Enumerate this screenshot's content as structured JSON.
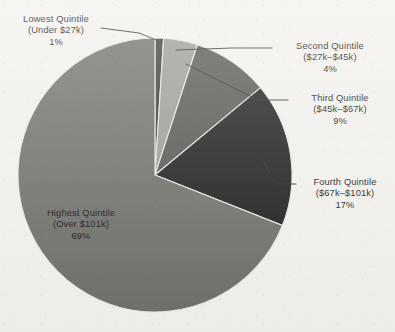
{
  "chart_data": {
    "type": "pie",
    "title": "",
    "subtitle": "",
    "xlabel": "",
    "ylabel": "",
    "legend_position": "callout-labels",
    "grid": false,
    "units": "percent",
    "start_angle_deg": 0,
    "direction": "clockwise",
    "categories": [
      "Lowest Quintile",
      "Second Quintile",
      "Third Quintile",
      "Fourth Quintile",
      "Highest Quintile"
    ],
    "values": [
      1,
      4,
      9,
      17,
      69
    ],
    "slices": [
      {
        "name": "Lowest Quintile",
        "range": "(Under $27k)",
        "percent": 1,
        "percent_label": "1%",
        "color": "#3a3a36",
        "label_placement": "outside",
        "leader_line": true
      },
      {
        "name": "Second Quintile",
        "range": "($27k–$45k)",
        "percent": 4,
        "percent_label": "4%",
        "color": "#9b9b96",
        "label_placement": "outside",
        "leader_line": true
      },
      {
        "name": "Third Quintile",
        "range": "($45k–$67k)",
        "percent": 9,
        "percent_label": "9%",
        "color": "#565651",
        "label_placement": "outside",
        "leader_line": true
      },
      {
        "name": "Fourth Quintile",
        "range": "($67k–$101k)",
        "percent": 17,
        "percent_label": "17%",
        "color": "#1d1d1b",
        "label_placement": "outside",
        "leader_line": true
      },
      {
        "name": "Highest Quintile",
        "range": "(Over $101k)",
        "percent": 69,
        "percent_label": "69%",
        "color": "#6f6f6a",
        "label_placement": "inside",
        "leader_line": false
      }
    ]
  },
  "canvas": {
    "background_color": "#f3f1ec",
    "text_color": "#1b1b1b",
    "leader_line_color": "#2a2a28",
    "slice_border_color": "#e9e7e2"
  },
  "labels": {
    "lowest": {
      "name": "Lowest Quintile",
      "range": "(Under $27k)",
      "percent": "1%"
    },
    "second": {
      "name": "Second Quintile",
      "range": "($27k–$45k)",
      "percent": "4%"
    },
    "third": {
      "name": "Third Quintile",
      "range": "($45k–$67k)",
      "percent": "9%"
    },
    "fourth": {
      "name": "Fourth Quintile",
      "range": "($67k–$101k)",
      "percent": "17%"
    },
    "highest": {
      "name": "Highest Quintile",
      "range": "(Over $101k)",
      "percent": "69%"
    }
  }
}
